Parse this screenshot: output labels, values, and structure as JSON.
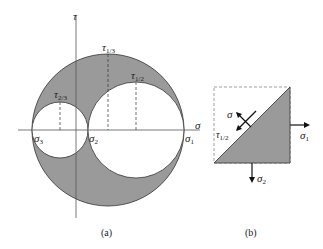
{
  "figure_a": {
    "axis_sigma": "σ",
    "axis_tau": "τ",
    "sigma1": "σ",
    "sigma1_sub": "1",
    "sigma2": "σ",
    "sigma2_sub": "2",
    "sigma3": "σ",
    "sigma3_sub": "3",
    "tau13": "τ",
    "tau13_sub": "1/3",
    "tau12": "τ",
    "tau12_sub": "1/2",
    "tau23": "τ",
    "tau23_sub": "2/3",
    "caption": "(a)"
  },
  "figure_b": {
    "sigma": "σ",
    "tau": "τ",
    "tau_sub": "1/2",
    "sigma1": "σ",
    "sigma1_sub": "1",
    "sigma2": "σ",
    "sigma2_sub": "2",
    "caption": "(b)"
  },
  "colors": {
    "fill": "#9a9a9a",
    "line": "#333333"
  }
}
